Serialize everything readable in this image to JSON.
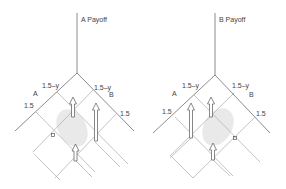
{
  "diagrams": [
    {
      "title": "A Payoff",
      "left_axis_label": "A",
      "right_axis_label": "B",
      "left_inner_tick": "1.5–y",
      "left_outer_tick": "1.5",
      "right_inner_tick": "1.5–y",
      "right_outer_tick": "1.5",
      "marker_label": "α"
    },
    {
      "title": "B Payoff",
      "left_axis_label": "A",
      "right_axis_label": "B",
      "left_inner_tick": "1.5–y",
      "left_outer_tick": "1.5",
      "right_inner_tick": "1.5–y",
      "right_outer_tick": "1.5",
      "marker_label": "α"
    }
  ],
  "colors": {
    "axis": "#6e6e6e",
    "grid": "#b4b4b4",
    "shade": "#e9e9e9",
    "text": "#444444"
  }
}
